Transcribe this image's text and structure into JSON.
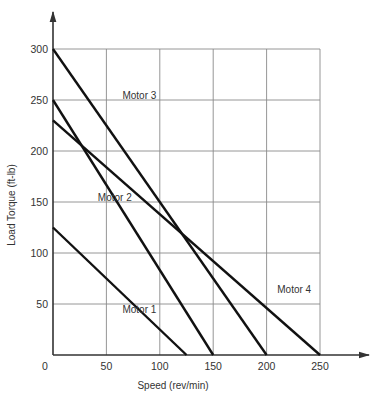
{
  "chart_data": {
    "type": "line",
    "title": "",
    "xlabel": "Speed (rev/min)",
    "ylabel": "Load Torque (ft-lb)",
    "xlim": [
      0,
      250
    ],
    "ylim": [
      0,
      300
    ],
    "grid": true,
    "x_ticks": [
      0,
      50,
      100,
      150,
      200,
      250
    ],
    "y_ticks": [
      50,
      100,
      150,
      200,
      250,
      300
    ],
    "x_tick_labels": [
      "0",
      "50",
      "100",
      "150",
      "200",
      "250"
    ],
    "y_tick_labels": [
      "50",
      "100",
      "150",
      "200",
      "250",
      "300"
    ],
    "legend": "inline labels",
    "series": [
      {
        "name": "Motor 1",
        "x": [
          0,
          125
        ],
        "y": [
          125,
          0
        ],
        "label_pos": [
          65,
          45
        ]
      },
      {
        "name": "Motor 2",
        "x": [
          0,
          150
        ],
        "y": [
          250,
          0
        ],
        "label_pos": [
          42,
          155
        ]
      },
      {
        "name": "Motor 3",
        "x": [
          0,
          200
        ],
        "y": [
          300,
          0
        ],
        "label_pos": [
          65,
          255
        ]
      },
      {
        "name": "Motor 4",
        "x": [
          0,
          250
        ],
        "y": [
          230,
          0
        ],
        "label_pos": [
          210,
          65
        ]
      }
    ],
    "annotations": [
      "Motor 2 and Motor 4 intersect near (33, 200)",
      "Motor 3 and Motor 4 intersect near (120, 120)"
    ]
  }
}
